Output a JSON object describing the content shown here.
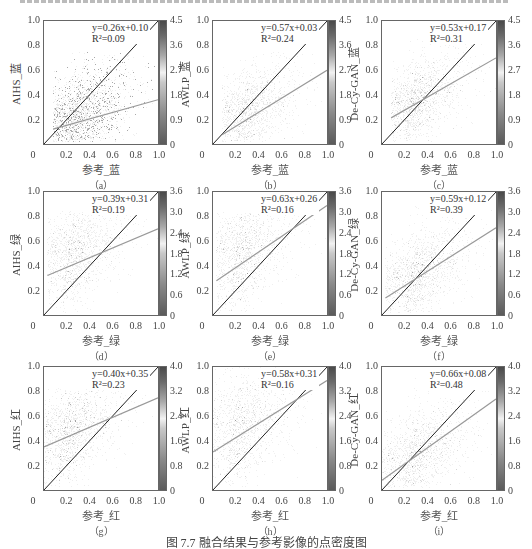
{
  "caption": "图 7.7   融合结果与参考影像的点密度图",
  "chart_data": [
    {
      "id": "a",
      "type": "heatmap",
      "subtitle": "（a）",
      "xlabel": "参考_蓝",
      "ylabel": "AIHS_蓝",
      "equation": "y=0.26x+0.10",
      "r2": "R²=0.09",
      "slope": 0.26,
      "intercept": 0.1,
      "r2_value": 0.09,
      "xlim": [
        0,
        1
      ],
      "ylim": [
        0,
        1
      ],
      "x_ticks": [
        "0",
        "0.2",
        "0.4",
        "0.6",
        "0.8",
        "1.0"
      ],
      "y_ticks": [
        "0.2",
        "0.4",
        "0.6",
        "0.8",
        "1.0"
      ],
      "colorbar_ticks": [
        "0",
        "0.9",
        "1.8",
        "2.7",
        "3.6",
        "4.5"
      ],
      "colorbar_max": 4.5,
      "cloud": {
        "cx": 0.22,
        "cy": 0.2,
        "sx": 0.14,
        "sy": 0.12,
        "rho": 0.2,
        "ymax": 0.75,
        "xmin": 0.08
      }
    },
    {
      "id": "b",
      "type": "heatmap",
      "subtitle": "（b）",
      "xlabel": "参考_蓝",
      "ylabel": "AWLP_蓝",
      "equation": "y=0.57x+0.03",
      "r2": "R²=0.24",
      "slope": 0.57,
      "intercept": 0.03,
      "r2_value": 0.24,
      "xlim": [
        0,
        1
      ],
      "ylim": [
        0,
        1
      ],
      "x_ticks": [
        "0",
        "0.2",
        "0.4",
        "0.6",
        "0.8",
        "1.0"
      ],
      "y_ticks": [
        "0.2",
        "0.4",
        "0.6",
        "0.8",
        "1.0"
      ],
      "colorbar_ticks": [
        "0",
        "0.9",
        "1.8",
        "2.7",
        "3.6",
        "4.5"
      ],
      "colorbar_max": 4.5,
      "cloud": {
        "cx": 0.22,
        "cy": 0.22,
        "sx": 0.14,
        "sy": 0.13,
        "rho": 0.3,
        "ymax": 0.75,
        "xmin": 0.08
      }
    },
    {
      "id": "c",
      "type": "heatmap",
      "subtitle": "（c）",
      "xlabel": "参考_蓝",
      "ylabel": "De-Cy-GAN_蓝",
      "equation": "y=0.53x+0.17",
      "r2": "R²=0.31",
      "slope": 0.53,
      "intercept": 0.17,
      "r2_value": 0.31,
      "xlim": [
        0,
        1
      ],
      "ylim": [
        0,
        1
      ],
      "x_ticks": [
        "0",
        "0.2",
        "0.4",
        "0.6",
        "0.8",
        "1.0"
      ],
      "y_ticks": [
        "0.2",
        "0.4",
        "0.6",
        "0.8",
        "1.0"
      ],
      "colorbar_ticks": [
        "0",
        "0.9",
        "1.8",
        "2.7",
        "3.6",
        "4.5"
      ],
      "colorbar_max": 4.5,
      "cloud": {
        "cx": 0.22,
        "cy": 0.3,
        "sx": 0.13,
        "sy": 0.13,
        "rho": 0.4,
        "ymax": 0.85,
        "xmin": 0.08
      }
    },
    {
      "id": "d",
      "type": "heatmap",
      "subtitle": "（d）",
      "xlabel": "参考_绿",
      "ylabel": "AIHS_绿",
      "equation": "y=0.39x+0.31",
      "r2": "R²=0.19",
      "slope": 0.39,
      "intercept": 0.31,
      "r2_value": 0.19,
      "xlim": [
        0,
        1
      ],
      "ylim": [
        0,
        1
      ],
      "x_ticks": [
        "0",
        "0.2",
        "0.4",
        "0.6",
        "0.8",
        "1.0"
      ],
      "y_ticks": [
        "0.2",
        "0.4",
        "0.6",
        "0.8",
        "1.0"
      ],
      "colorbar_ticks": [
        "0",
        "0.6",
        "1.2",
        "1.8",
        "2.4",
        "3.0",
        "3.6"
      ],
      "colorbar_max": 3.6,
      "cloud": {
        "cx": 0.18,
        "cy": 0.45,
        "sx": 0.14,
        "sy": 0.17,
        "rho": 0.3,
        "ymax": 0.85,
        "xmin": 0.03
      }
    },
    {
      "id": "e",
      "type": "heatmap",
      "subtitle": "（e）",
      "xlabel": "参考_绿",
      "ylabel": "AWLP_绿",
      "equation": "y=0.63x+0.26",
      "r2": "R²=0.16",
      "slope": 0.63,
      "intercept": 0.26,
      "r2_value": 0.16,
      "xlim": [
        0,
        1
      ],
      "ylim": [
        0,
        1
      ],
      "x_ticks": [
        "0",
        "0.2",
        "0.4",
        "0.6",
        "0.8",
        "1.0"
      ],
      "y_ticks": [
        "0.2",
        "0.4",
        "0.6",
        "0.8",
        "1.0"
      ],
      "colorbar_ticks": [
        "0",
        "0.6",
        "1.2",
        "1.8",
        "2.4",
        "3.0",
        "3.6"
      ],
      "colorbar_max": 3.6,
      "cloud": {
        "cx": 0.17,
        "cy": 0.45,
        "sx": 0.13,
        "sy": 0.2,
        "rho": 0.25,
        "ymax": 0.83,
        "xmin": 0.03
      }
    },
    {
      "id": "f",
      "type": "heatmap",
      "subtitle": "（f）",
      "xlabel": "参考_绿",
      "ylabel": "De-Cy-GAN_绿",
      "equation": "y=0.59x+0.12",
      "r2": "R²=0.39",
      "slope": 0.59,
      "intercept": 0.12,
      "r2_value": 0.39,
      "xlim": [
        0,
        1
      ],
      "ylim": [
        0,
        1
      ],
      "x_ticks": [
        "0",
        "0.2",
        "0.4",
        "0.6",
        "0.8",
        "1.0"
      ],
      "y_ticks": [
        "0.2",
        "0.4",
        "0.6",
        "0.8",
        "1.0"
      ],
      "colorbar_ticks": [
        "0",
        "0.6",
        "1.2",
        "1.8",
        "2.4",
        "3.0",
        "3.6"
      ],
      "colorbar_max": 3.6,
      "cloud": {
        "cx": 0.22,
        "cy": 0.27,
        "sx": 0.15,
        "sy": 0.14,
        "rho": 0.45,
        "ymax": 0.9,
        "xmin": 0.03
      }
    },
    {
      "id": "g",
      "type": "heatmap",
      "subtitle": "（g）",
      "xlabel": "参考_红",
      "ylabel": "AIHS_红",
      "equation": "y=0.40x+0.35",
      "r2": "R²=0.23",
      "slope": 0.4,
      "intercept": 0.35,
      "r2_value": 0.23,
      "xlim": [
        0,
        1
      ],
      "ylim": [
        0,
        1
      ],
      "x_ticks": [
        "0",
        "0.2",
        "0.4",
        "0.6",
        "0.8",
        "1.0"
      ],
      "y_ticks": [
        "0.2",
        "0.4",
        "0.6",
        "0.8",
        "1.0"
      ],
      "colorbar_ticks": [
        "0",
        "0.8",
        "1.6",
        "2.4",
        "3.2",
        "4.0"
      ],
      "colorbar_max": 4.0,
      "cloud": {
        "cx": 0.14,
        "cy": 0.42,
        "sx": 0.15,
        "sy": 0.17,
        "rho": 0.35,
        "ymax": 0.83,
        "xmin": 0.0
      }
    },
    {
      "id": "h",
      "type": "heatmap",
      "subtitle": "（h）",
      "xlabel": "参考_红",
      "ylabel": "AWLP_红",
      "equation": "y=0.58x+0.31",
      "r2": "R²=0.16",
      "slope": 0.58,
      "intercept": 0.31,
      "r2_value": 0.16,
      "xlim": [
        0,
        1
      ],
      "ylim": [
        0,
        1
      ],
      "x_ticks": [
        "0",
        "0.2",
        "0.4",
        "0.6",
        "0.8",
        "1.0"
      ],
      "y_ticks": [
        "0.2",
        "0.4",
        "0.6",
        "0.8",
        "1.0"
      ],
      "colorbar_ticks": [
        "0",
        "0.8",
        "1.6",
        "2.4",
        "3.2",
        "4.0"
      ],
      "colorbar_max": 4.0,
      "cloud": {
        "cx": 0.14,
        "cy": 0.45,
        "sx": 0.18,
        "sy": 0.22,
        "rho": 0.3,
        "ymax": 1.0,
        "xmin": 0.0
      }
    },
    {
      "id": "i",
      "type": "heatmap",
      "subtitle": "（i）",
      "xlabel": "参考_红",
      "ylabel": "De-Cy-GAN_红",
      "equation": "y=0.66x+0.08",
      "r2": "R²=0.48",
      "slope": 0.66,
      "intercept": 0.08,
      "r2_value": 0.48,
      "xlim": [
        0,
        1
      ],
      "ylim": [
        0,
        1
      ],
      "x_ticks": [
        "0",
        "0.2",
        "0.4",
        "0.6",
        "0.8",
        "1.0"
      ],
      "y_ticks": [
        "0.2",
        "0.4",
        "0.6",
        "0.8",
        "1.0"
      ],
      "colorbar_ticks": [
        "0",
        "0.8",
        "1.6",
        "2.4",
        "3.2",
        "4.0"
      ],
      "colorbar_max": 4.0,
      "cloud": {
        "cx": 0.2,
        "cy": 0.22,
        "sx": 0.18,
        "sy": 0.16,
        "rho": 0.5,
        "ymax": 1.0,
        "xmin": 0.0
      }
    }
  ],
  "layout": {
    "columns_x": [
      0,
      169,
      338
    ],
    "rows_y": [
      20,
      191,
      366
    ]
  }
}
